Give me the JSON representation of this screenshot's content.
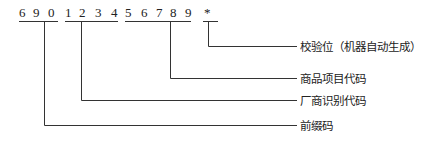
{
  "barcode": {
    "groups": [
      {
        "name": "prefix",
        "digits": [
          "6",
          "9",
          "0"
        ]
      },
      {
        "name": "manufacturer",
        "digits": [
          "1",
          "2",
          "3",
          "4"
        ]
      },
      {
        "name": "product",
        "digits": [
          "5",
          "6",
          "7",
          "8",
          "9"
        ]
      },
      {
        "name": "check",
        "digits": [
          "*"
        ]
      }
    ]
  },
  "labels": {
    "check": "校验位（机器自动生成）",
    "product": "商品项目代码",
    "manufacturer": "厂商识别代码",
    "prefix": "前缀码"
  }
}
